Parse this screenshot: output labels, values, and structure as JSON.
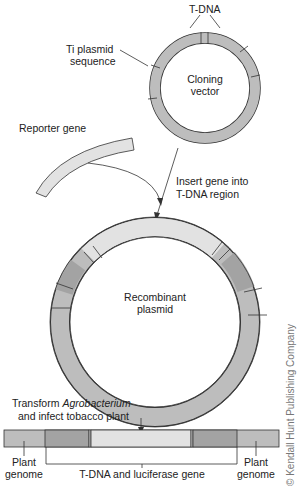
{
  "labels": {
    "tdna_top": "T-DNA",
    "ti_plasmid_line1": "Ti plasmid",
    "ti_plasmid_line2": "sequence",
    "cloning_vector_line1": "Cloning",
    "cloning_vector_line2": "vector",
    "reporter_gene": "Reporter gene",
    "insert_line1": "Insert gene into",
    "insert_line2": "T-DNA region",
    "recombinant_line1": "Recombinant",
    "recombinant_line2": "plasmid",
    "transform_prefix": "Transform ",
    "transform_italic": "Agrobacterium",
    "transform_line2": "and infect tobacco plant",
    "plant_genome_left_line1": "Plant",
    "plant_genome_left_line2": "genome",
    "plant_genome_right_line1": "Plant",
    "plant_genome_right_line2": "genome",
    "tdna_luciferase": "T-DNA and luciferase gene",
    "copyright": "© Kendall Hunt Publishing Company"
  },
  "colors": {
    "ring_gray": "#bdbdbd",
    "dark_gray": "#a3a3a3",
    "light_gray": "#e2e2e2",
    "outline": "#333333"
  }
}
